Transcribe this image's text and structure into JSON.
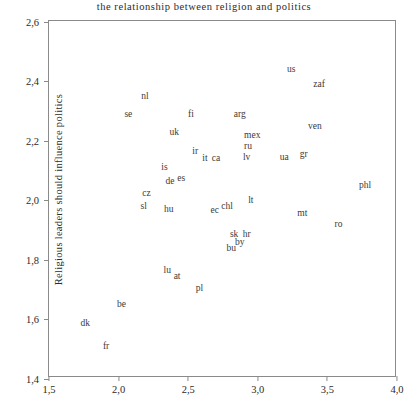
{
  "chart_data": {
    "type": "scatter",
    "title": "the  relationship  between  religion  and  politics",
    "xlabel": "",
    "ylabel": "Religious leaders should influence politics",
    "xlim": [
      1.5,
      4.0
    ],
    "ylim": [
      1.4,
      2.6
    ],
    "xticks": [
      "1,5",
      "2,0",
      "2,5",
      "3,0",
      "3,5",
      "4,0"
    ],
    "xtick_values": [
      1.5,
      2.0,
      2.5,
      3.0,
      3.5,
      4.0
    ],
    "yticks": [
      "2,6",
      "2,4",
      "2,2",
      "2,0",
      "1,8",
      "1,6",
      "1,4"
    ],
    "ytick_values": [
      2.6,
      2.4,
      2.2,
      2.0,
      1.8,
      1.6,
      1.4
    ],
    "grid": false,
    "legend": "none",
    "decimal_separator": ",",
    "marker_style": "text-label",
    "points": [
      {
        "label": "nl",
        "x": 2.19,
        "y": 2.345
      },
      {
        "label": "se",
        "x": 2.07,
        "y": 2.285
      },
      {
        "label": "fi",
        "x": 2.52,
        "y": 2.285
      },
      {
        "label": "arg",
        "x": 2.87,
        "y": 2.285
      },
      {
        "label": "us",
        "x": 3.24,
        "y": 2.435
      },
      {
        "label": "zaf",
        "x": 3.44,
        "y": 2.385
      },
      {
        "label": "ven",
        "x": 3.41,
        "y": 2.245
      },
      {
        "label": "uk",
        "x": 2.4,
        "y": 2.225
      },
      {
        "label": "mex",
        "x": 2.96,
        "y": 2.215
      },
      {
        "label": "ru",
        "x": 2.93,
        "y": 2.175
      },
      {
        "label": "ir",
        "x": 2.55,
        "y": 2.16
      },
      {
        "label": "it",
        "x": 2.62,
        "y": 2.135
      },
      {
        "label": "ca",
        "x": 2.7,
        "y": 2.135
      },
      {
        "label": "lv",
        "x": 2.92,
        "y": 2.14
      },
      {
        "label": "ua",
        "x": 3.19,
        "y": 2.14
      },
      {
        "label": "gr",
        "x": 3.33,
        "y": 2.15
      },
      {
        "label": "is",
        "x": 2.33,
        "y": 2.105
      },
      {
        "label": "de",
        "x": 2.37,
        "y": 2.06
      },
      {
        "label": "es",
        "x": 2.45,
        "y": 2.07
      },
      {
        "label": "phl",
        "x": 3.77,
        "y": 2.045
      },
      {
        "label": "cz",
        "x": 2.2,
        "y": 2.02
      },
      {
        "label": "sl",
        "x": 2.18,
        "y": 1.975
      },
      {
        "label": "hu",
        "x": 2.36,
        "y": 1.965
      },
      {
        "label": "ec",
        "x": 2.69,
        "y": 1.96
      },
      {
        "label": "chl",
        "x": 2.78,
        "y": 1.975
      },
      {
        "label": "lt",
        "x": 2.95,
        "y": 1.995
      },
      {
        "label": "mt",
        "x": 3.32,
        "y": 1.95
      },
      {
        "label": "ro",
        "x": 3.58,
        "y": 1.915
      },
      {
        "label": "sk",
        "x": 2.83,
        "y": 1.88
      },
      {
        "label": "hr",
        "x": 2.92,
        "y": 1.88
      },
      {
        "label": "by",
        "x": 2.87,
        "y": 1.855
      },
      {
        "label": "bu",
        "x": 2.81,
        "y": 1.835
      },
      {
        "label": "lu",
        "x": 2.35,
        "y": 1.76
      },
      {
        "label": "at",
        "x": 2.42,
        "y": 1.74
      },
      {
        "label": "pl",
        "x": 2.58,
        "y": 1.7
      },
      {
        "label": "be",
        "x": 2.02,
        "y": 1.645
      },
      {
        "label": "dk",
        "x": 1.76,
        "y": 1.58
      },
      {
        "label": "fr",
        "x": 1.91,
        "y": 1.505
      }
    ]
  }
}
